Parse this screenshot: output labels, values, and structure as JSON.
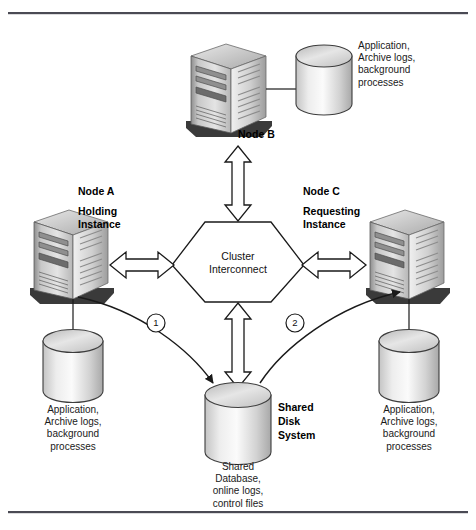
{
  "diagram": {
    "frame": {
      "top_rule": true,
      "bottom_rule": true
    },
    "colors": {
      "line": "#1a1a1a",
      "rule": "#4a4a54",
      "server_light": "#d8d8d8",
      "server_mid": "#b4b4b4",
      "server_dark": "#5e5e5e",
      "cylinder_light": "#f2f2f2",
      "cylinder_mid": "#c9c9c9",
      "cylinder_dark": "#9a9a9a"
    },
    "nodes": [
      {
        "id": "node-b",
        "name": "Node B",
        "role": "",
        "db_caption": "Application,\nArchive logs,\nbackground\nprocesses"
      },
      {
        "id": "node-a",
        "name": "Node A",
        "role": "Holding\nInstance",
        "db_caption": "Application,\nArchive logs,\nbackground\nprocesses"
      },
      {
        "id": "node-c",
        "name": "Node C",
        "role": "Requesting\nInstance",
        "db_caption": "Application,\nArchive logs,\nbackground\nprocesses"
      }
    ],
    "interconnect": {
      "line1": "Cluster",
      "line2": "Interconnect"
    },
    "shared_disk": {
      "title": "Shared\nDisk\nSystem",
      "caption": "Shared\nDatabase,\nonline logs,\ncontrol files"
    },
    "flow_markers": [
      {
        "id": "marker-1",
        "label": "1"
      },
      {
        "id": "marker-2",
        "label": "2"
      }
    ]
  }
}
